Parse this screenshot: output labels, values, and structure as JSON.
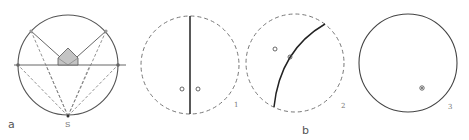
{
  "figure": {
    "panel_a": {
      "label": "a",
      "point_label": "S",
      "description": "Stereographic construction: circle with horizontal diameter, projection lines from pole S, shaded region near center"
    },
    "panel_b": {
      "label": "b",
      "subpanels": [
        {
          "number": "1",
          "description": "dashed circle with vertical straight great circle, two small circles"
        },
        {
          "number": "2",
          "description": "dashed circle with curved great circle arc, two small circles"
        },
        {
          "number": "3",
          "description": "solid circle with a single marked point"
        }
      ]
    },
    "colors": {
      "stroke": "#444444",
      "dashed": "#777777",
      "shade": "#bdbdbd"
    }
  }
}
